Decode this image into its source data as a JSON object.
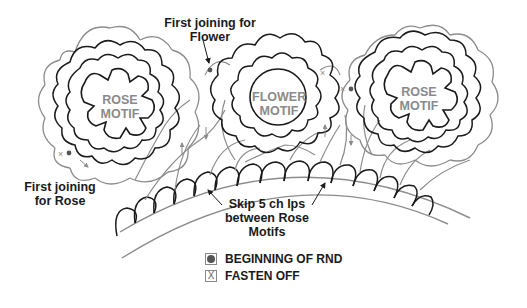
{
  "motifs": [
    {
      "id": "left-rose",
      "label_line1": "ROSE",
      "label_line2": "MOTIF"
    },
    {
      "id": "center-flower",
      "label_line1": "FLOWER",
      "label_line2": "MOTIF"
    },
    {
      "id": "right-rose",
      "label_line1": "ROSE",
      "label_line2": "MOTIF"
    }
  ],
  "annotations": {
    "first_joining_flower": {
      "line1": "First joining for",
      "line2": "Flower"
    },
    "first_joining_rose": {
      "line1": "First joining",
      "line2": "for Rose"
    },
    "skip_loops": {
      "line1": "Skip 5 ch lps",
      "line2": "between Rose",
      "line3": "Motifs"
    }
  },
  "legend": [
    {
      "symbol": "filled-circle",
      "glyph": "",
      "label": "BEGINNING OF RND"
    },
    {
      "symbol": "x-mark",
      "glyph": "X",
      "label": "FASTEN OFF"
    }
  ],
  "colors": {
    "outline_dark": "#1a1a1a",
    "outline_gray": "#8c8c8c",
    "motif_text": "#8a8a8a",
    "marker": "#555555"
  }
}
